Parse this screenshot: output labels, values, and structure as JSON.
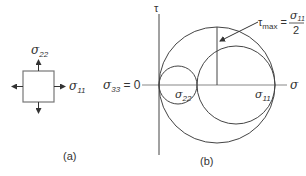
{
  "panel_a": {
    "caption": "(a)",
    "labels": {
      "sigma22": "σ",
      "sigma22_sub": "22",
      "sigma11": "σ",
      "sigma11_sub": "11"
    }
  },
  "panel_b": {
    "caption": "(b)",
    "axis_tau": "τ",
    "axis_sigma": "σ",
    "sigma33_label": "σ",
    "sigma33_sub": "33",
    "sigma33_value": " = 0",
    "circle_label_22": "σ",
    "circle_label_22_sub": "22",
    "circle_label_11": "σ",
    "circle_label_11_sub": "11",
    "tau_max": {
      "tau": "τ",
      "sub": "max",
      "eq": "=",
      "numerator": "σ",
      "numerator_sub": "11",
      "denominator": "2"
    }
  },
  "colors": {
    "line": "#444444",
    "axis": "#888888",
    "text": "#333333"
  }
}
